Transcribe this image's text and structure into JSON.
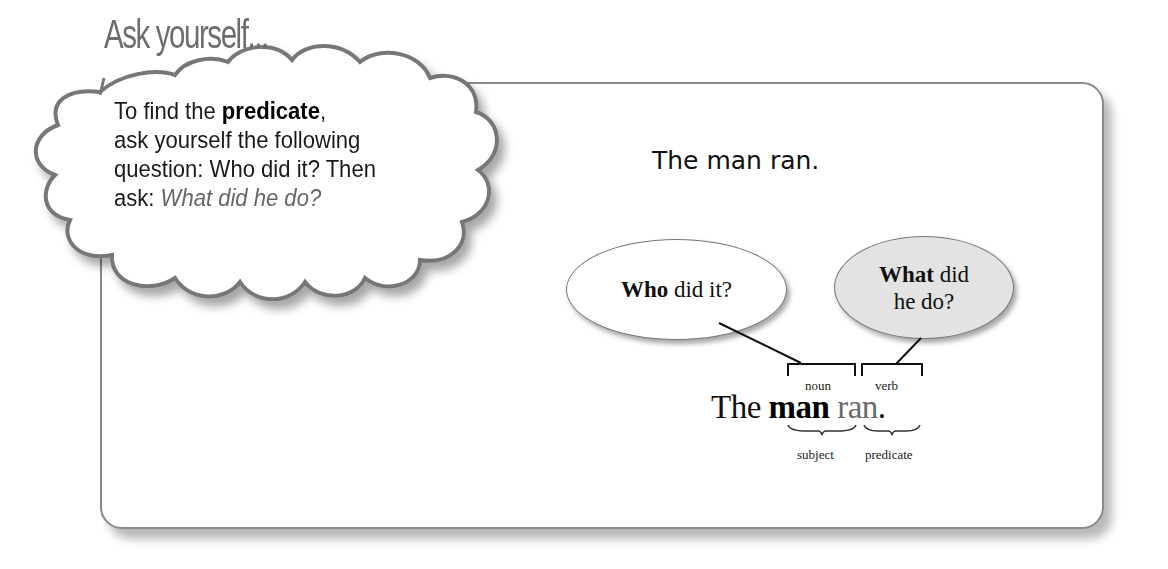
{
  "title": "Ask yourself...",
  "cloud": {
    "line1_prefix": "To find the ",
    "line1_bold": "predicate",
    "line1_suffix": ",",
    "line2": "ask yourself the following",
    "line3": "question: Who did it? Then",
    "line4_prefix": "ask: ",
    "line4_italic": "What did he do?"
  },
  "diagram": {
    "sentence_plain": "The man ran.",
    "who_oval": {
      "bold": "Who",
      "rest": " did it?"
    },
    "what_oval": {
      "bold": "What",
      "rest": " did",
      "line2": "he do?"
    },
    "bracket_labels": {
      "noun": "noun",
      "verb": "verb"
    },
    "sentence": {
      "the": "The ",
      "subject": "man",
      "space": " ",
      "predicate": "ran",
      "period": "."
    },
    "brace_labels": {
      "subject": "subject",
      "predicate": "predicate"
    }
  },
  "colors": {
    "border": "#8a8a8a",
    "what_fill": "#e3e3e3",
    "title": "#6e6e6e"
  }
}
